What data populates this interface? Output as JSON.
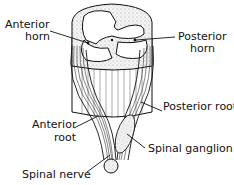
{
  "figure": {
    "labels": {
      "anterior_horn_1": "Anterior",
      "anterior_horn_2": "horn",
      "posterior_horn_1": "Posterior",
      "posterior_horn_2": "horn",
      "posterior_root": "Posterior root",
      "anterior_root_1": "Anterior",
      "anterior_root_2": "root",
      "spinal_ganglion": "Spinal ganglion",
      "spinal_nerve": "Spinal nerve"
    },
    "colors": {
      "ink": "#111111",
      "background": "#ffffff",
      "stipple": "#e6e6e6"
    }
  }
}
